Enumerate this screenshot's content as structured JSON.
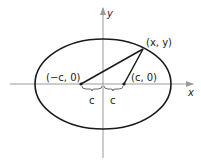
{
  "diagram": {
    "axes": {
      "x_label": "x",
      "y_label": "y"
    },
    "point_label": "(x, y)",
    "left_focus_label": "(−c, 0)",
    "right_focus_label": "(c, 0)",
    "left_distance_label": "c",
    "right_distance_label": "c",
    "colors": {
      "axis": "#9a9a9a",
      "curve": "#1a1a1a",
      "text": "#222222"
    }
  }
}
